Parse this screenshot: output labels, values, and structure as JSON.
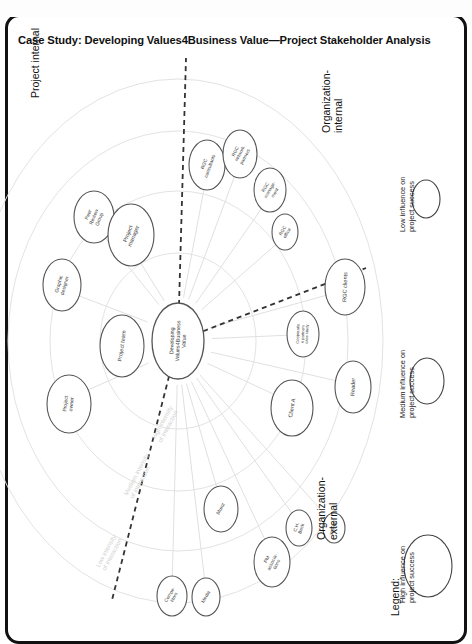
{
  "page": {
    "title": "Case Study: Developing Values4Business Value—Project Stakeholder Analysis"
  },
  "center": {
    "label": "Developing\nValues4Business\nValue"
  },
  "quadrants": [
    {
      "name": "project-internal",
      "label": "Project internal"
    },
    {
      "name": "organization-internal",
      "label": "Organization-\ninternal"
    },
    {
      "name": "organization-external",
      "label": "Organization-\nexternal"
    }
  ],
  "rings": [
    {
      "name": "high-intensity",
      "label": "High intensity\nof interaction"
    },
    {
      "name": "medium-intensity",
      "label": "Medium intensity\nof interaction"
    },
    {
      "name": "low-intensity",
      "label": "Low intensity\nof interaction"
    }
  ],
  "stakeholders": [
    {
      "name": "peer-review-group",
      "label": "Peer\nReview\nGroup",
      "cx": 94,
      "cy": 217,
      "rx": 20,
      "ry": 26,
      "rot": -68,
      "fs": 5.0
    },
    {
      "name": "project-manager",
      "label": "Project\nmanager",
      "cx": 131,
      "cy": 235,
      "rx": 23,
      "ry": 31,
      "rot": -68,
      "fs": 5.6
    },
    {
      "name": "graphic-designer",
      "label": "Graphic\ndesigner",
      "cx": 62,
      "cy": 285,
      "rx": 19,
      "ry": 26,
      "rot": -74,
      "fs": 5.0
    },
    {
      "name": "project-team",
      "label": "Project team",
      "cx": 122,
      "cy": 346,
      "rx": 22,
      "ry": 31,
      "rot": -82,
      "fs": 5.6
    },
    {
      "name": "project-owner",
      "label": "Project\nowner",
      "cx": 69,
      "cy": 404,
      "rx": 22,
      "ry": 29,
      "rot": -84,
      "fs": 5.2
    },
    {
      "name": "rgc-consultants",
      "label": "RGC\nconsultants",
      "cx": 207,
      "cy": 165,
      "rx": 18,
      "ry": 25,
      "rot": -70,
      "fs": 4.8
    },
    {
      "name": "rgc-network-partners",
      "label": "RGC\nnetwork\npartners",
      "cx": 240,
      "cy": 154,
      "rx": 17,
      "ry": 24,
      "rot": -62,
      "fs": 4.6
    },
    {
      "name": "rgc-management",
      "label": "RGC\nmanage-\nment",
      "cx": 270,
      "cy": 190,
      "rx": 16,
      "ry": 22,
      "rot": -60,
      "fs": 4.6
    },
    {
      "name": "rgc-office",
      "label": "RGC\noffice",
      "cx": 285,
      "cy": 232,
      "rx": 13,
      "ry": 18,
      "rot": -60,
      "fs": 4.6
    },
    {
      "name": "rgc-clients",
      "label": "RGC clients",
      "cx": 345,
      "cy": 287,
      "rx": 20,
      "ry": 28,
      "rot": -88,
      "fs": 5.6
    },
    {
      "name": "cooperation-partners",
      "label": "Cooperatio\nn partners\ncase study",
      "cx": 303,
      "cy": 334,
      "rx": 16,
      "ry": 23,
      "rot": -88,
      "fs": 4.0
    },
    {
      "name": "reader",
      "label": "Reader",
      "cx": 353,
      "cy": 387,
      "rx": 18,
      "ry": 26,
      "rot": -88,
      "fs": 5.6
    },
    {
      "name": "client-a",
      "label": "Client A",
      "cx": 292,
      "cy": 408,
      "rx": 21,
      "ry": 28,
      "rot": -80,
      "fs": 5.6
    },
    {
      "name": "ch-beck",
      "label": "C.H.\nBeck",
      "cx": 299,
      "cy": 528,
      "rx": 13,
      "ry": 18,
      "rot": -72,
      "fs": 4.6
    },
    {
      "name": "stampfli",
      "label": "Stämpfli",
      "cx": 334,
      "cy": 528,
      "rx": 11,
      "ry": 15,
      "rot": -72,
      "fs": 4.2
    },
    {
      "name": "pm-associations",
      "label": "PM\nassocia-\ntions",
      "cx": 272,
      "cy": 562,
      "rx": 18,
      "ry": 25,
      "rot": -64,
      "fs": 4.8
    },
    {
      "name": "munz",
      "label": "Munz",
      "cx": 221,
      "cy": 509,
      "rx": 17,
      "ry": 23,
      "rot": -62,
      "fs": 5.0
    },
    {
      "name": "media",
      "label": "Media",
      "cx": 206,
      "cy": 597,
      "rx": 14,
      "ry": 19,
      "rot": -60,
      "fs": 4.8
    },
    {
      "name": "competitors",
      "label": "Compe-\ntitors",
      "cx": 172,
      "cy": 596,
      "rx": 15,
      "ry": 20,
      "rot": -60,
      "fs": 4.6
    }
  ],
  "legend": {
    "title": "Legend:",
    "items": [
      {
        "name": "legend-low",
        "label": "Low influence on\nproject success",
        "rx": 14,
        "ry": 19
      },
      {
        "name": "legend-medium",
        "label": "Medium influence on\nproject success",
        "rx": 17,
        "ry": 23
      },
      {
        "name": "legend-high",
        "label": "High influence on\nproject success",
        "rx": 24,
        "ry": 31
      }
    ]
  },
  "colors": {
    "node_stroke": "#555555",
    "ring_stroke": "#e3e3e3",
    "spoke_stroke": "#e0e0e0",
    "divider": "#333333",
    "frame": "#111111"
  }
}
